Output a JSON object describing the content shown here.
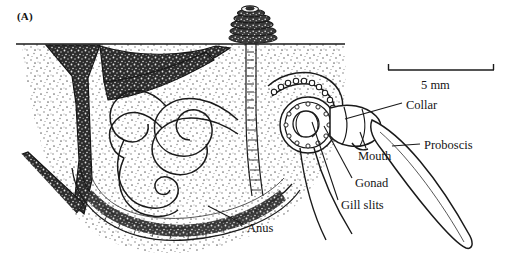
{
  "figure": {
    "panel_label": "(A)",
    "background_color": "#ffffff",
    "ink_color": "#1a1a1a"
  },
  "scale_bar": {
    "label": "5 mm",
    "value": 5,
    "unit": "mm",
    "bar_x_start": 388,
    "bar_x_end": 494,
    "bar_y": 70
  },
  "labels": [
    {
      "id": "collar",
      "text": "Collar",
      "x": 406,
      "y": 99,
      "leader_to_x": 345,
      "leader_to_y": 118
    },
    {
      "id": "proboscis",
      "text": "Proboscis",
      "x": 424,
      "y": 139,
      "leader_to_x": 392,
      "leader_to_y": 146
    },
    {
      "id": "mouth",
      "text": "Mouth",
      "x": 358,
      "y": 150,
      "leader_to_x": 360,
      "leader_to_y": 131
    },
    {
      "id": "gonad",
      "text": "Gonad",
      "x": 355,
      "y": 177,
      "leader_to_x": 323,
      "leader_to_y": 125
    },
    {
      "id": "gill-slits",
      "text": "Gill slits",
      "x": 341,
      "y": 199,
      "leader_to_x": 311,
      "leader_to_y": 121
    },
    {
      "id": "anus",
      "text": "Anus",
      "x": 247,
      "y": 222,
      "leader_to_x": 206,
      "leader_to_y": 205
    }
  ],
  "anatomy_parts": [
    "proboscis",
    "collar",
    "mouth",
    "gill slits",
    "gonad",
    "trunk",
    "anus"
  ],
  "scene_elements": [
    "sediment block with stipple texture",
    "sediment surface line",
    "dark Y-shaped burrow branch",
    "vertical burrow shaft",
    "coiled fecal cast on surface",
    "U-shaped burrow tube with lined wall",
    "coiled worm trunk"
  ]
}
